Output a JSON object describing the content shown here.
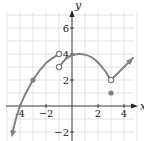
{
  "chart_data": {
    "type": "line",
    "title": "",
    "xlabel": "x",
    "ylabel": "y",
    "xlim": [
      -5,
      5
    ],
    "ylim": [
      -3,
      7.5
    ],
    "grid": true,
    "x_ticks": [
      {
        "value": -4,
        "label": "-4"
      },
      {
        "value": -2,
        "label": "−2"
      },
      {
        "value": 2,
        "label": "2"
      },
      {
        "value": 4,
        "label": "4"
      }
    ],
    "y_ticks": [
      {
        "value": -2,
        "label": "−2"
      },
      {
        "value": 2,
        "label": "2"
      },
      {
        "value": 4,
        "label": "4"
      },
      {
        "value": 6,
        "label": "6"
      }
    ],
    "series": [
      {
        "name": "left-parabola",
        "description": "Increasing curve from arrow at lower left through (-4,0) and (-3,2) to open point (-1,4)",
        "points": [
          [
            -4.6,
            -2.1
          ],
          [
            -4,
            0
          ],
          [
            -3,
            2
          ],
          [
            -2,
            3.3
          ],
          [
            -1,
            4
          ]
        ],
        "start_arrow": true,
        "end": {
          "x": -1,
          "y": 4,
          "type": "open"
        }
      },
      {
        "name": "middle-arch",
        "description": "Arch from open point (-1,3) up to maximum near (0.5,4) down to open point (3,2)",
        "points": [
          [
            -1,
            3
          ],
          [
            -0.5,
            3.6
          ],
          [
            0,
            3.9
          ],
          [
            0.5,
            4
          ],
          [
            1,
            3.95
          ],
          [
            1.5,
            3.75
          ],
          [
            2,
            3.35
          ],
          [
            2.5,
            2.75
          ],
          [
            3,
            2
          ]
        ],
        "start": {
          "x": -1,
          "y": 3,
          "type": "open"
        },
        "end": {
          "x": 3,
          "y": 2,
          "type": "open"
        }
      },
      {
        "name": "right-ray",
        "description": "Straight ray from (3,2) rising to the right",
        "points": [
          [
            3,
            2
          ],
          [
            4.7,
            3.7
          ]
        ],
        "end_arrow": true
      }
    ],
    "isolated_points": [
      {
        "x": -3,
        "y": 2,
        "type": "closed"
      },
      {
        "x": 3,
        "y": 1,
        "type": "closed"
      }
    ]
  }
}
